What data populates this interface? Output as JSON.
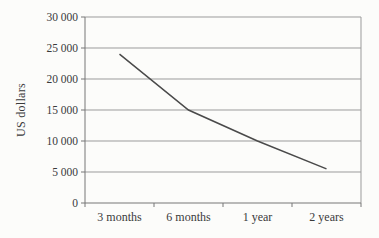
{
  "chart_data": {
    "type": "line",
    "categories": [
      "3 months",
      "6 months",
      "1 year",
      "2 years"
    ],
    "values": [
      24000,
      15000,
      10000,
      5500
    ],
    "series": [
      {
        "name": "depreciation",
        "values": [
          24000,
          15000,
          10000,
          5500
        ]
      }
    ],
    "title": "",
    "xlabel": "",
    "ylabel": "US dollars",
    "ylim": [
      0,
      30000
    ],
    "ytick_step": 5000,
    "ytick_values": [
      0,
      5000,
      10000,
      15000,
      20000,
      25000,
      30000
    ],
    "ytick_labels": [
      "0",
      "5 000",
      "10 000",
      "15 000",
      "20 000",
      "25 000",
      "30 000"
    ],
    "grid": "horizontal",
    "legend": "none",
    "colors": {
      "line": "#4a4a4a",
      "grid": "#9b9b9b",
      "axis": "#767676",
      "text": "#3a3a3a",
      "background": "#fcfcfa"
    }
  }
}
